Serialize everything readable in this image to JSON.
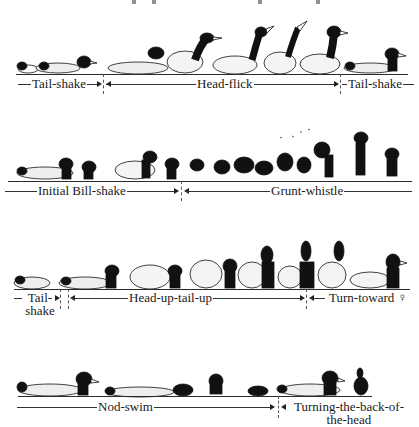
{
  "figure": {
    "top_fragments": [
      "partial text cut off at top edge"
    ]
  },
  "rows": [
    {
      "labels": [
        {
          "text": "Tail-shake"
        },
        {
          "text": "Head-flick"
        },
        {
          "text": "Tail-shake"
        }
      ]
    },
    {
      "labels": [
        {
          "text": "Initial Bill-shake"
        },
        {
          "text": "Grunt-whistle"
        }
      ]
    },
    {
      "labels": [
        {
          "line1": "Tail-",
          "line2": "shake"
        },
        {
          "text": "Head-up-tail-up"
        },
        {
          "text": "Turn-toward ♀"
        }
      ]
    },
    {
      "labels": [
        {
          "text": "Nod-swim"
        },
        {
          "line1": "Turning-the-back-of-",
          "line2": "the-head"
        }
      ]
    }
  ],
  "icons": {
    "duck": "mallard-drake-illustration",
    "female": "♀"
  }
}
